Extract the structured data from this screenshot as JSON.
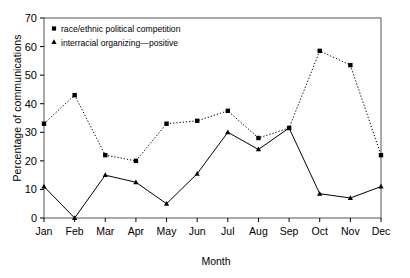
{
  "chart_data": {
    "type": "line",
    "title": "",
    "xlabel": "Month",
    "ylabel": "Percentage of communications",
    "categories": [
      "Jan",
      "Feb",
      "Mar",
      "Apr",
      "May",
      "Jun",
      "Jul",
      "Aug",
      "Sep",
      "Oct",
      "Nov",
      "Dec"
    ],
    "ylim": [
      0,
      70
    ],
    "yticks": [
      0,
      10,
      20,
      30,
      40,
      50,
      60,
      70
    ],
    "grid": false,
    "legend_position": "top-left",
    "series": [
      {
        "name": "race/ethnic political competition",
        "marker": "square",
        "linestyle": "dotted",
        "color": "#000000",
        "values": [
          33,
          43,
          22,
          20,
          33,
          34,
          37.5,
          28,
          31.5,
          58.5,
          53.5,
          22
        ]
      },
      {
        "name": "interracial organizing—positive",
        "marker": "triangle",
        "linestyle": "solid",
        "color": "#000000",
        "values": [
          11,
          0,
          15,
          12.5,
          5,
          15.5,
          30,
          24,
          31.5,
          8.5,
          7,
          11
        ]
      }
    ]
  },
  "axes": {
    "y_tick_labels": [
      "0",
      "10",
      "20",
      "30",
      "40",
      "50",
      "60",
      "70"
    ],
    "x_tick_labels": [
      "Jan",
      "Feb",
      "Mar",
      "Apr",
      "May",
      "Jun",
      "Jul",
      "Aug",
      "Sep",
      "Oct",
      "Nov",
      "Dec"
    ],
    "y_axis_title": "Percentage of communications",
    "x_axis_title": "Month"
  },
  "legend": {
    "items": [
      {
        "label": "race/ethnic political competition",
        "marker": "square-marker"
      },
      {
        "label": "interracial organizing—positive",
        "marker": "triangle-marker"
      }
    ]
  }
}
